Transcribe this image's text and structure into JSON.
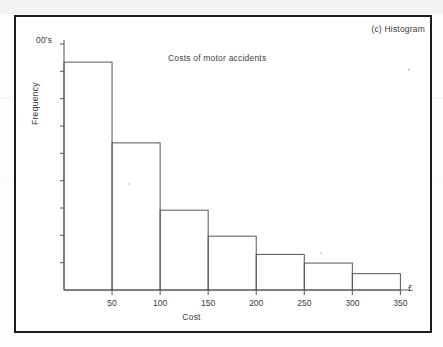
{
  "figure": {
    "caption": "(c) Histogram",
    "frame_color": "#1c1c1c",
    "background": "#ffffff"
  },
  "chart_data": {
    "type": "bar",
    "title": "Costs of motor accidents",
    "xlabel": "Cost",
    "ylabel": "Frequency",
    "y_unit_label": "00's",
    "currency_symbol": "£",
    "grid": false,
    "legend": "none",
    "categories": [
      "0-50",
      "50-100",
      "100-150",
      "150-200",
      "200-250",
      "250-300",
      "300-350"
    ],
    "bin_edges": [
      0,
      50,
      100,
      150,
      200,
      250,
      300,
      350
    ],
    "values": [
      2370,
      1530,
      830,
      560,
      370,
      280,
      170
    ],
    "values_in_hundreds": [
      23.7,
      15.3,
      8.3,
      5.6,
      3.7,
      2.8,
      1.7
    ],
    "x_tick_labels": [
      "50",
      "100",
      "150",
      "200",
      "250",
      "300",
      "350"
    ],
    "x_tick_values": [
      50,
      100,
      150,
      200,
      250,
      300,
      350
    ],
    "xlim": [
      0,
      360
    ],
    "ylim": [
      0,
      2600
    ],
    "y_tick_count": 9,
    "y_tick_labels": [],
    "bar_stroke": "#555555",
    "bar_fill": "none",
    "axis_color": "#555555"
  }
}
